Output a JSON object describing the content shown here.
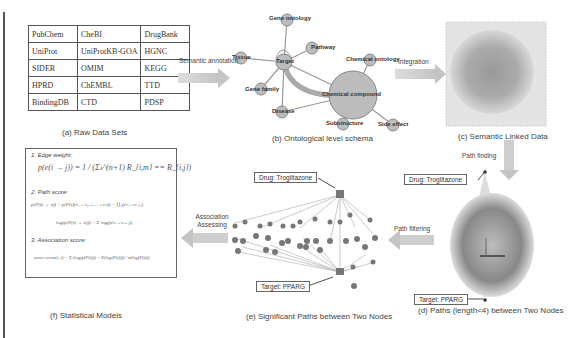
{
  "panels": {
    "a": {
      "caption": "(a) Raw Data Sets",
      "table": [
        [
          "PubChem",
          "CheBI",
          "DrugBank"
        ],
        [
          "UniProt",
          "UniProtKB-GOA",
          "HGNC"
        ],
        [
          "SIDER",
          "OMIM",
          "KEGG"
        ],
        [
          "HPRD",
          "ChEMBL",
          "TTD"
        ],
        [
          "BindingDB",
          "CTD",
          "PDSP"
        ]
      ]
    },
    "b": {
      "caption": "(b) Ontological level schema",
      "nodes": [
        "Gene ontology",
        "Pathway",
        "Tissue",
        "Target",
        "Gene family",
        "Disease",
        "Chemical ontology",
        "Chemical compound",
        "Substructure",
        "Side effect"
      ]
    },
    "c": {
      "caption": "(c) Semantic Linked Data"
    },
    "d": {
      "caption": "(d) Paths (length<4) between Two Nodes",
      "drug_label": "Drug: Troglitazone",
      "target_label": "Target: PPARG"
    },
    "e": {
      "caption": "(e) Significant Paths between Two Nodes",
      "drug_label": "Drug: Troglitazone",
      "target_label": "Target: PPARG"
    },
    "f": {
      "caption": "(f) Statistical Models",
      "items": [
        {
          "label": "1. Edge weight:",
          "eq": "p(e(i → j)) = 1 / (Σₖ^(n+1) R_{i,m} ==  R_{i,j})"
        },
        {
          "label": "2. Path score:",
          "eq": "p(P(t) → x)) = p(P(t)(v₁→v₂→…→vₙ)) = ∏ p(vᵢ→vᵢ₊₁)",
          "eq2": "log(p(P(t) → x))) = Σ log(p(vᵢ→vᵢ₊₁))"
        },
        {
          "label": "3. Association score:",
          "eq": "assoc score(s, t) = Σ (log(p(P(t))) − E(log(P(t)))) / σ(log(P(t)))"
        }
      ]
    }
  },
  "arrows": {
    "semantic_annotation": "Semantic annotation",
    "integration": "Integration",
    "path_finding": "Path finding",
    "path_filtering": "Path filtering",
    "association_assessing": "Association Assessing"
  },
  "colors": {
    "arrow": "#c8c8c8",
    "node": "#b8b8b8",
    "edge": "#999999",
    "border": "#555555"
  }
}
